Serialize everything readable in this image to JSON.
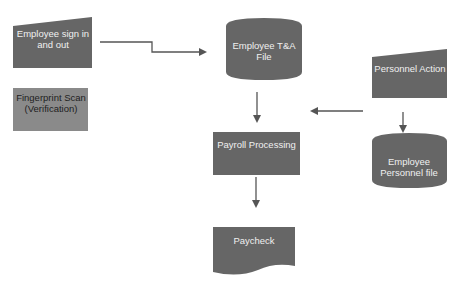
{
  "diagram": {
    "type": "flowchart",
    "colors": {
      "shape_fill": "#6a6a6a",
      "shape_fill_light": "#8c8c8c",
      "arrow": "#555555",
      "background": "#ffffff"
    },
    "nodes": [
      {
        "id": "sign_in",
        "shape": "manual-input",
        "label": "Employee sign in and out"
      },
      {
        "id": "fingerprint",
        "shape": "process",
        "label": "Fingerprint Scan (Verification)"
      },
      {
        "id": "ta_file",
        "shape": "database",
        "label": "Employee T&A File"
      },
      {
        "id": "personnel_action",
        "shape": "manual-input",
        "label": "Personnel Action"
      },
      {
        "id": "payroll",
        "shape": "process",
        "label": "Payroll Processing"
      },
      {
        "id": "personnel_file",
        "shape": "database",
        "label": "Employee Personnel file"
      },
      {
        "id": "paycheck",
        "shape": "document",
        "label": "Paycheck"
      }
    ],
    "edges": [
      {
        "from": "sign_in",
        "to": "ta_file"
      },
      {
        "from": "ta_file",
        "to": "payroll"
      },
      {
        "from": "personnel_action",
        "to": "payroll"
      },
      {
        "from": "personnel_action",
        "to": "personnel_file"
      },
      {
        "from": "payroll",
        "to": "paycheck"
      }
    ]
  }
}
